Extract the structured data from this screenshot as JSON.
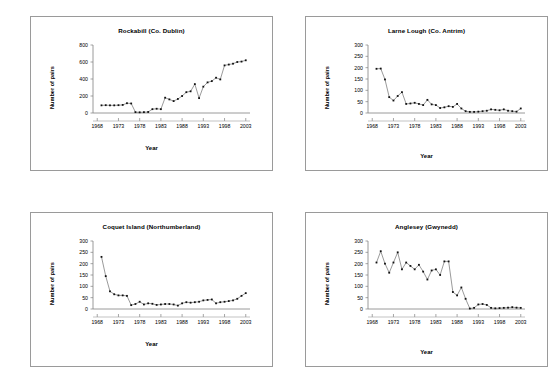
{
  "figure": {
    "axis_labels": {
      "x": "Year",
      "y": "Number of pairs"
    },
    "panel_count": 4
  },
  "chart_data": [
    {
      "type": "line",
      "title": "Rockabill (Co. Dublin)",
      "xlabel": "Year",
      "ylabel": "Number of pairs",
      "xlim": [
        1967,
        2004
      ],
      "ylim": [
        0,
        800
      ],
      "yticks": [
        0,
        200,
        400,
        600,
        800
      ],
      "xticks": [
        1968,
        1973,
        1978,
        1983,
        1988,
        1993,
        1998,
        2003
      ],
      "grid": false,
      "legend": "none",
      "marker": "diamond",
      "x": [
        1969,
        1970,
        1971,
        1972,
        1973,
        1974,
        1975,
        1976,
        1977,
        1978,
        1979,
        1980,
        1981,
        1982,
        1983,
        1984,
        1985,
        1986,
        1987,
        1988,
        1989,
        1990,
        1991,
        1992,
        1993,
        1994,
        1995,
        1996,
        1997,
        1998,
        1999,
        2000,
        2001,
        2002,
        2003
      ],
      "values": [
        90,
        92,
        90,
        90,
        92,
        95,
        115,
        112,
        10,
        8,
        10,
        12,
        45,
        50,
        45,
        180,
        160,
        140,
        165,
        200,
        245,
        255,
        340,
        175,
        310,
        360,
        375,
        415,
        395,
        560,
        570,
        580,
        600,
        605,
        620,
        615,
        595,
        640
      ]
    },
    {
      "type": "line",
      "title": "Larne Lough (Co. Antrim)",
      "xlabel": "Year",
      "ylabel": "Number of pairs",
      "xlim": [
        1967,
        2004
      ],
      "ylim": [
        0,
        300
      ],
      "yticks": [
        0,
        50,
        100,
        150,
        200,
        250,
        300
      ],
      "xticks": [
        1968,
        1973,
        1978,
        1983,
        1988,
        1993,
        1998,
        2003
      ],
      "grid": false,
      "legend": "none",
      "marker": "diamond",
      "x": [
        1969,
        1970,
        1971,
        1972,
        1973,
        1974,
        1975,
        1976,
        1977,
        1978,
        1979,
        1980,
        1981,
        1982,
        1983,
        1984,
        1985,
        1986,
        1987,
        1988,
        1989,
        1990,
        1991,
        1992,
        1993,
        1994,
        1995,
        1996,
        1997,
        1998,
        1999,
        2000,
        2001,
        2002,
        2003
      ],
      "values": [
        195,
        196,
        148,
        70,
        55,
        75,
        92,
        40,
        42,
        45,
        40,
        35,
        58,
        38,
        35,
        22,
        25,
        30,
        27,
        40,
        20,
        8,
        5,
        5,
        6,
        8,
        10,
        16,
        14,
        12,
        16,
        10,
        8,
        6,
        20
      ]
    },
    {
      "type": "line",
      "title": "Coquet Island (Northumberland)",
      "xlabel": "Year",
      "ylabel": "Number of pairs",
      "xlim": [
        1967,
        2004
      ],
      "ylim": [
        0,
        300
      ],
      "yticks": [
        0,
        50,
        100,
        150,
        200,
        250,
        300
      ],
      "xticks": [
        1968,
        1973,
        1978,
        1983,
        1988,
        1993,
        1998,
        2003
      ],
      "grid": false,
      "legend": "none",
      "marker": "diamond",
      "x": [
        1969,
        1970,
        1971,
        1972,
        1973,
        1974,
        1975,
        1976,
        1977,
        1978,
        1979,
        1980,
        1981,
        1982,
        1983,
        1984,
        1985,
        1986,
        1987,
        1988,
        1989,
        1990,
        1991,
        1992,
        1993,
        1994,
        1995,
        1996,
        1997,
        1998,
        1999,
        2000,
        2001,
        2002,
        2003
      ],
      "values": [
        230,
        145,
        78,
        65,
        60,
        60,
        58,
        17,
        22,
        32,
        20,
        25,
        23,
        18,
        20,
        22,
        22,
        20,
        15,
        25,
        30,
        28,
        30,
        32,
        38,
        40,
        42,
        25,
        30,
        32,
        35,
        38,
        45,
        58,
        70
      ]
    },
    {
      "type": "line",
      "title": "Anglesey (Gwynedd)",
      "xlabel": "Year",
      "ylabel": "Number of pairs",
      "xlim": [
        1967,
        2004
      ],
      "ylim": [
        0,
        300
      ],
      "yticks": [
        0,
        50,
        100,
        150,
        200,
        250,
        300
      ],
      "xticks": [
        1968,
        1973,
        1978,
        1983,
        1988,
        1993,
        1998,
        2003
      ],
      "grid": false,
      "legend": "none",
      "marker": "diamond",
      "x": [
        1969,
        1970,
        1971,
        1972,
        1973,
        1974,
        1975,
        1976,
        1977,
        1978,
        1979,
        1980,
        1981,
        1982,
        1983,
        1984,
        1985,
        1986,
        1987,
        1988,
        1989,
        1990,
        1991,
        1992,
        1993,
        1994,
        1995,
        1996,
        1997,
        1998,
        1999,
        2000,
        2001,
        2002,
        2003
      ],
      "values": [
        205,
        255,
        200,
        160,
        205,
        250,
        175,
        205,
        190,
        175,
        195,
        165,
        130,
        170,
        175,
        150,
        210,
        210,
        75,
        60,
        95,
        45,
        2,
        5,
        20,
        22,
        18,
        5,
        3,
        4,
        5,
        6,
        8,
        6,
        5
      ]
    }
  ]
}
